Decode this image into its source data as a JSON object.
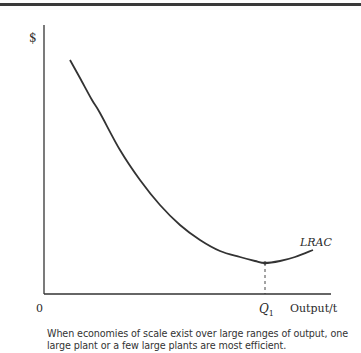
{
  "chart_data": {
    "type": "line",
    "title": "",
    "xlabel": "Output/t",
    "ylabel": "$",
    "origin_label": "0",
    "series": [
      {
        "name": "LRAC",
        "points": [
          [
            70,
            60
          ],
          [
            80,
            78
          ],
          [
            92,
            100
          ],
          [
            100,
            113
          ],
          [
            120,
            150
          ],
          [
            140,
            180
          ],
          [
            160,
            205
          ],
          [
            180,
            225
          ],
          [
            200,
            240
          ],
          [
            220,
            251
          ],
          [
            240,
            257
          ],
          [
            255,
            261
          ],
          [
            265,
            263
          ],
          [
            280,
            261
          ],
          [
            295,
            257
          ],
          [
            313,
            250
          ]
        ]
      }
    ],
    "annotations": [
      {
        "label": "Q1",
        "description": "Output at minimum LRAC",
        "marker_x": 265,
        "marker_y": 263
      }
    ],
    "x_tick_labels": [
      "Q1"
    ],
    "grid": false,
    "legend": "none"
  },
  "labels": {
    "y_axis": "$",
    "origin": "0",
    "q_main": "Q",
    "q_sub": "1",
    "x_axis": "Output/t",
    "curve": "LRAC"
  },
  "caption": "When economies of scale exist over large ranges of output, one large plant or a few large plants are most efficient."
}
